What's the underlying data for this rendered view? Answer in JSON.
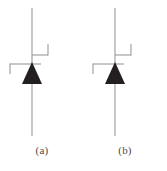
{
  "figure": {
    "background_color": "#ffffff",
    "line_color": "#9a9a9a",
    "fill_color": "#231f20",
    "caption_color": "#4a4a4a"
  },
  "symbols": [
    {
      "id": "symbol-a",
      "caption": "(a)",
      "device": "thyristor",
      "anode_lead": {
        "x": 32,
        "y1": 8,
        "y2": 62
      },
      "cathode_lead": {
        "x": 32,
        "y1": 84,
        "y2": 136
      },
      "triangle": {
        "apex_x": 32,
        "apex_y": 62,
        "left_x": 22,
        "right_x": 42,
        "base_y": 84
      },
      "gate_horizontal": {
        "x1": 10,
        "x2": 41,
        "y": 64
      },
      "gate_left_stub": {
        "x": 10,
        "y1": 64,
        "y2": 73
      },
      "gate_upper_line": {
        "x1": 32,
        "x2": 48,
        "y": 55
      },
      "gate_upper_stub": {
        "x": 48,
        "y1": 44,
        "y2": 55
      }
    },
    {
      "id": "symbol-b",
      "caption": "(b)",
      "device": "thyristor",
      "anode_lead": {
        "x": 32,
        "y1": 8,
        "y2": 62
      },
      "cathode_lead": {
        "x": 32,
        "y1": 84,
        "y2": 136
      },
      "triangle": {
        "apex_x": 32,
        "apex_y": 62,
        "left_x": 22,
        "right_x": 42,
        "base_y": 84
      },
      "gate_horizontal": {
        "x1": 10,
        "x2": 41,
        "y": 64
      },
      "gate_left_stub": {
        "x": 10,
        "y1": 64,
        "y2": 73
      },
      "gate_upper_line": {
        "x1": 32,
        "x2": 48,
        "y": 55
      },
      "gate_upper_stub": {
        "x": 48,
        "y1": 44,
        "y2": 55
      }
    }
  ]
}
